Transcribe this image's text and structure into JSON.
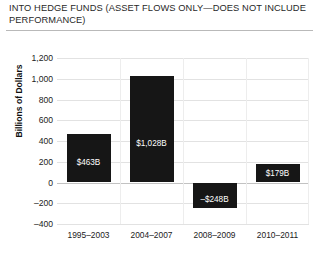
{
  "chart_data": {
    "type": "bar",
    "title": "INTO HEDGE FUNDS (ASSET FLOWS ONLY—DOES NOT INCLUDE PERFORMANCE)",
    "xlabel": "",
    "ylabel": "Billions of Dollars",
    "categories": [
      "1995–2003",
      "2004–2007",
      "2008–2009",
      "2010–2011"
    ],
    "values": [
      463,
      1028,
      -248,
      179
    ],
    "data_labels": [
      "$463B",
      "$1,028B",
      "–$248B",
      "$179B"
    ],
    "ylim": [
      -400,
      1200
    ],
    "ytick_values": [
      1200,
      1000,
      800,
      600,
      400,
      200,
      0,
      -200,
      -400
    ],
    "ytick_labels": [
      "1,200",
      "1,000",
      "800",
      "600",
      "400",
      "200",
      "0",
      "–200",
      "–400"
    ],
    "grid": "horizontal-and-vertical",
    "legend": "none",
    "bar_color": "#161616",
    "gridline_color": "#e2e2e2",
    "zero_line_color": "#c2c2c2",
    "label_text_color": "#ffffff",
    "background_color": "#ffffff"
  }
}
